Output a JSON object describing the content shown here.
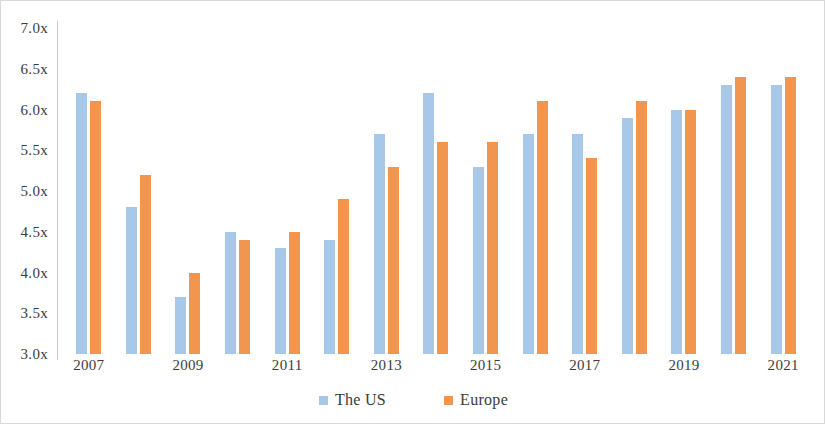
{
  "chart_data": {
    "type": "bar",
    "title": "",
    "subtitle": "",
    "xlabel": "",
    "ylabel": "",
    "ylim": [
      3.0,
      7.0
    ],
    "ytick_labels": [
      "7.0x",
      "6.5x",
      "6.0x",
      "5.5x",
      "5.0x",
      "4.5x",
      "4.0x",
      "3.5x",
      "3.0x"
    ],
    "ytick_values": [
      7.0,
      6.5,
      6.0,
      5.5,
      5.0,
      4.5,
      4.0,
      3.5,
      3.0
    ],
    "categories": [
      "2007",
      "2008",
      "2009",
      "2010",
      "2011",
      "2012",
      "2013",
      "2014",
      "2015",
      "2016",
      "2017",
      "2018",
      "2019",
      "2020",
      "2021"
    ],
    "xtick_labels": [
      "2007",
      "2009",
      "2011",
      "2013",
      "2015",
      "2017",
      "2019",
      "2021"
    ],
    "grid": false,
    "legend_position": "bottom",
    "series": [
      {
        "name": "The US",
        "color": "#a8c8ea",
        "values": [
          6.2,
          4.8,
          3.7,
          4.5,
          4.3,
          4.4,
          5.7,
          6.2,
          5.3,
          5.7,
          5.7,
          5.9,
          6.0,
          6.3,
          6.3
        ]
      },
      {
        "name": "Europe",
        "color": "#f2964f",
        "values": [
          6.1,
          5.2,
          4.0,
          4.4,
          4.5,
          4.9,
          5.3,
          5.6,
          5.6,
          6.1,
          5.4,
          6.1,
          6.0,
          6.4,
          6.4
        ]
      }
    ]
  },
  "legend": {
    "items": [
      {
        "label": "The US",
        "color": "#a8c8ea"
      },
      {
        "label": "Europe",
        "color": "#f2964f"
      }
    ]
  }
}
